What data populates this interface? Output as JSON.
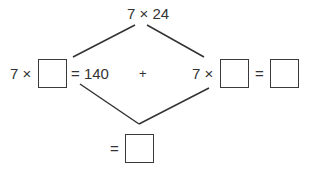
{
  "diagram": {
    "top_expression": "7 × 24",
    "left_prefix": "7 ×",
    "left_result": "= 140",
    "plus_sign": "+",
    "right_prefix": "7 ×",
    "right_equals": "=",
    "bottom_equals": "=",
    "boxes": [
      "",
      "",
      "",
      ""
    ]
  }
}
